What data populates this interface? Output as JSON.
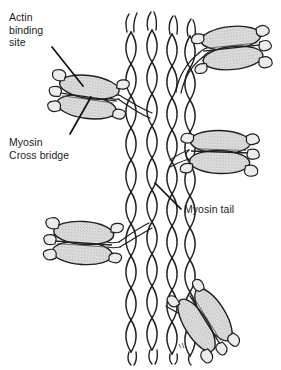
{
  "figure": {
    "background_color": "#ffffff",
    "ink_color": "#1b1b1b",
    "head_fill_color": "#d8d8d8",
    "width": 281,
    "height": 370,
    "labels": [
      {
        "id": "actin-binding-site",
        "lines": [
          "Actin",
          "binding",
          "site"
        ],
        "text": "Actin\nbinding\nsite",
        "leader_from": [
          52,
          47
        ],
        "leader_to": [
          82,
          86
        ]
      },
      {
        "id": "myosin-cross-bridge",
        "lines": [
          "Myosin",
          "Cross bridge"
        ],
        "text": "Myosin\nCross bridge",
        "leader_from": [
          70,
          134
        ],
        "leader_to": [
          90,
          98
        ]
      },
      {
        "id": "myosin-tail",
        "lines": [
          "Myosin tail"
        ],
        "text": "Myosin tail",
        "leader_from": [
          181,
          209
        ],
        "leader_to": [
          155,
          183
        ]
      }
    ],
    "filament": {
      "name": "myosin-thick-filament",
      "description": "Vertical bundle of braided coiled-coil myosin tail strands running top to bottom, frayed at both ends",
      "strand_bundles": 4,
      "x_center": 152,
      "top": 30,
      "bottom": 352
    },
    "myosin_heads": [
      {
        "id": "head-left-upper",
        "x": 88,
        "y": 97,
        "rotation": -8,
        "facing": "left"
      },
      {
        "id": "head-right-upper",
        "x": 232,
        "y": 48,
        "rotation": -6,
        "facing": "right"
      },
      {
        "id": "head-right-mid",
        "x": 220,
        "y": 152,
        "rotation": 2,
        "facing": "right"
      },
      {
        "id": "head-left-lower",
        "x": 83,
        "y": 243,
        "rotation": -4,
        "facing": "left"
      },
      {
        "id": "head-right-lower",
        "x": 205,
        "y": 320,
        "rotation": 58,
        "facing": "right"
      }
    ],
    "artist_mark": {
      "id": "artist-signature",
      "x": 182,
      "y": 346
    }
  }
}
